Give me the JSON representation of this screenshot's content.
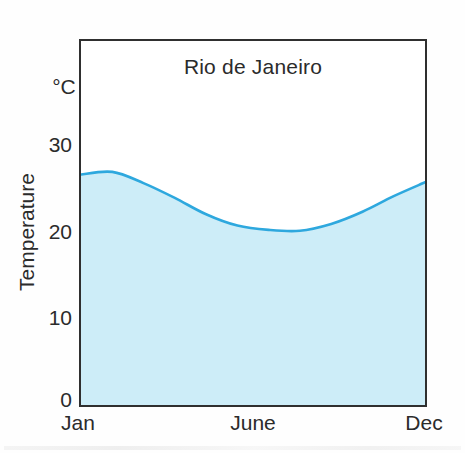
{
  "figure": {
    "title": "Rio de Janeiro",
    "y_unit": "°C",
    "y_axis_label": "Temperature"
  },
  "chart_data": {
    "type": "area",
    "title": "Rio de Janeiro",
    "xlabel": "",
    "ylabel": "Temperature",
    "y_unit": "°C",
    "x": [
      "Jan",
      "Feb",
      "Mar",
      "Apr",
      "May",
      "Jun",
      "Jul",
      "Aug",
      "Sep",
      "Oct",
      "Nov",
      "Dec"
    ],
    "values": [
      26.6,
      26.9,
      25.6,
      23.9,
      22.0,
      20.7,
      20.2,
      20.1,
      20.9,
      22.3,
      24.1,
      25.7
    ],
    "ylim": [
      0,
      42
    ],
    "yticks": [
      "30",
      "20",
      "10",
      "0"
    ],
    "ytick_values": [
      30,
      20,
      10,
      0
    ],
    "xtick_labels": [
      "Jan",
      "June",
      "Dec"
    ],
    "grid": false,
    "legend": "none",
    "line_color": "#2ea8de",
    "fill_color": "#cdedf8",
    "axis_color": "#2f2f2f"
  }
}
